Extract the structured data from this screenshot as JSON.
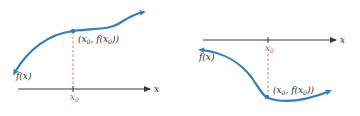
{
  "colors": {
    "curve": "#2f7fbf",
    "axis": "#3a3a3a",
    "dashed": "#d9534f",
    "x0_label": "#c0504d",
    "text": "#2a2a2a"
  },
  "panels": [
    {
      "name": "increasing-function",
      "function_label": "f(x)",
      "point_label_parts": [
        "(x",
        "0",
        ", f(x",
        "0",
        "))"
      ],
      "x_axis_label": "x",
      "x0_label": "x",
      "x0_sub": "0"
    },
    {
      "name": "decreasing-function",
      "function_label": "f(x)",
      "point_label_parts": [
        "(x",
        "0",
        ", f(x",
        "0",
        "))"
      ],
      "x_axis_label": "x",
      "x0_label": "x",
      "x0_sub": "0"
    }
  ]
}
